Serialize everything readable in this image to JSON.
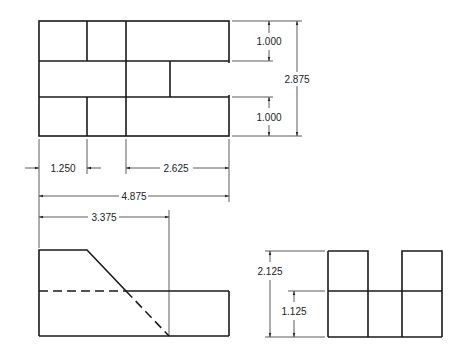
{
  "drawing": {
    "type": "orthographic-projection",
    "views": [
      "top",
      "front",
      "side"
    ]
  },
  "dimensions": {
    "top_slot_height": "1.000",
    "bottom_slot_height": "1.000",
    "overall_depth": "2.875",
    "left_width": "1.250",
    "right_width": "2.625",
    "overall_width": "4.875",
    "ramp_end": "3.375",
    "side_overall_height": "2.125",
    "side_lower_height": "1.125"
  },
  "colors": {
    "line": "#1a1a1a",
    "background": "#ffffff"
  }
}
